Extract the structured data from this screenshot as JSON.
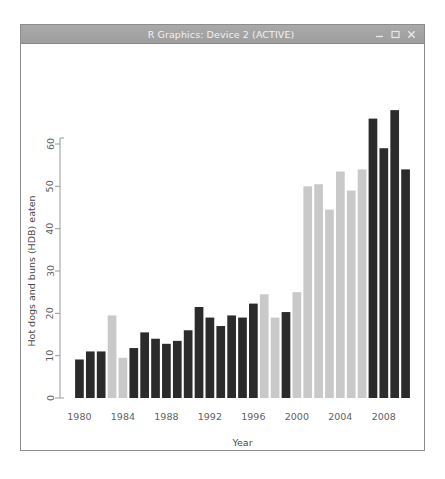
{
  "window": {
    "title": "R Graphics: Device 2 (ACTIVE)",
    "buttons": {
      "minimize": "minimize",
      "maximize": "maximize",
      "close": "close"
    }
  },
  "colors": {
    "bar_dark": "#2b2b2b",
    "bar_light": "#c9c9c9",
    "axis": "#9a9a9a",
    "tick_text": "#5f5f5f",
    "titlebar": "#a3a3a3",
    "window_border": "#8c8c8c",
    "plot_background": "#ffffff"
  },
  "chart_data": {
    "type": "bar",
    "title": "",
    "xlabel": "Year",
    "ylabel": "Hot dogs and buns (HDB) eaten",
    "ylim": [
      0,
      68
    ],
    "xlim": [
      1979.3,
      2010.7
    ],
    "grid": false,
    "legend": "none",
    "yticks": [
      0,
      10,
      20,
      30,
      40,
      50,
      60
    ],
    "ytick_labels": [
      "0",
      "10",
      "20",
      "30",
      "40",
      "50",
      "60"
    ],
    "xticks": [
      1980,
      1984,
      1988,
      1992,
      1996,
      2000,
      2004,
      2008
    ],
    "xtick_labels": [
      "1980",
      "1984",
      "1988",
      "1992",
      "1996",
      "2000",
      "2004",
      "2008"
    ],
    "categories": [
      1980,
      1981,
      1982,
      1983,
      1984,
      1985,
      1986,
      1987,
      1988,
      1989,
      1990,
      1991,
      1992,
      1993,
      1994,
      1995,
      1996,
      1997,
      1998,
      1999,
      2000,
      2001,
      2002,
      2003,
      2004,
      2005,
      2006,
      2007,
      2008,
      2009,
      2010
    ],
    "values": [
      9.1,
      11.0,
      11.0,
      19.5,
      9.5,
      11.8,
      15.5,
      14.0,
      12.8,
      13.5,
      16.0,
      21.5,
      19.0,
      17.0,
      19.5,
      19.0,
      22.3,
      24.5,
      19.0,
      20.3,
      25.0,
      50.0,
      50.5,
      44.5,
      53.5,
      49.0,
      54.0,
      66.0,
      59.0,
      68.0,
      54.0
    ],
    "bar_colors": [
      "#2b2b2b",
      "#2b2b2b",
      "#2b2b2b",
      "#c9c9c9",
      "#c9c9c9",
      "#2b2b2b",
      "#2b2b2b",
      "#2b2b2b",
      "#2b2b2b",
      "#2b2b2b",
      "#2b2b2b",
      "#2b2b2b",
      "#2b2b2b",
      "#2b2b2b",
      "#2b2b2b",
      "#2b2b2b",
      "#2b2b2b",
      "#c9c9c9",
      "#c9c9c9",
      "#2b2b2b",
      "#c9c9c9",
      "#c9c9c9",
      "#c9c9c9",
      "#c9c9c9",
      "#c9c9c9",
      "#c9c9c9",
      "#c9c9c9",
      "#2b2b2b",
      "#2b2b2b",
      "#2b2b2b",
      "#2b2b2b"
    ],
    "series": [
      {
        "name": "Hot dogs and buns (HDB) eaten",
        "values": [
          9.1,
          11.0,
          11.0,
          19.5,
          9.5,
          11.8,
          15.5,
          14.0,
          12.8,
          13.5,
          16.0,
          21.5,
          19.0,
          17.0,
          19.5,
          19.0,
          22.3,
          24.5,
          19.0,
          20.3,
          25.0,
          50.0,
          50.5,
          44.5,
          53.5,
          49.0,
          54.0,
          66.0,
          59.0,
          68.0,
          54.0
        ]
      }
    ]
  }
}
